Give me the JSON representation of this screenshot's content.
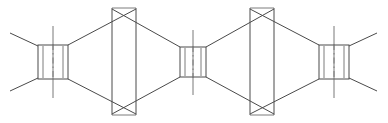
{
  "figure": {
    "background_color": "#ffffff",
    "line_color": "#4a4a4a",
    "secondary_line_color": "#7a7a7a",
    "width": 388,
    "height": 123,
    "view": "front elevation",
    "projection": "orthographic"
  },
  "chart_data": {
    "type": "line",
    "xlabel": "",
    "ylabel": "",
    "xlim": [
      0,
      388
    ],
    "ylim": [
      0,
      123
    ],
    "grid": false,
    "legend": "none"
  },
  "components": {
    "hubs": [
      {
        "name": "left-hub",
        "label": "Left hub",
        "x_left": 38,
        "x_right": 68,
        "y_top": 45,
        "y_bottom": 79,
        "inner_left": 43,
        "inner_right": 63,
        "center_x": 53,
        "has_vertical_axis": true,
        "has_center_dashdot": true
      },
      {
        "name": "middle-hub",
        "label": "Middle hub",
        "x_left": 180,
        "x_right": 206,
        "y_top": 47,
        "y_bottom": 77,
        "inner_left": 185,
        "inner_right": 201,
        "center_x": 193,
        "has_vertical_axis": true,
        "has_center_dashdot": true
      },
      {
        "name": "right-hub",
        "label": "Right hub",
        "x_left": 319,
        "x_right": 349,
        "y_top": 45,
        "y_bottom": 79,
        "inner_left": 324,
        "inner_right": 344,
        "center_x": 334,
        "has_vertical_axis": true,
        "has_center_dashdot": true
      }
    ],
    "cones": [
      {
        "name": "left-cone",
        "label": "Left conical section",
        "small_x": 68,
        "large_x": 180,
        "small_top_y": 45,
        "small_bottom_y": 79,
        "large_top_y": 9,
        "large_bottom_y": 114,
        "direction": "expanding-right-then-contracting"
      },
      {
        "name": "right-cone",
        "label": "Right conical section",
        "small_x": 319,
        "large_x": 206,
        "small_top_y": 45,
        "small_bottom_y": 79,
        "large_top_y": 9,
        "large_bottom_y": 114,
        "direction": "expanding-left-then-contracting"
      }
    ],
    "flanges": [
      {
        "name": "left-flange",
        "label": "Left flange plate",
        "x_left": 112,
        "x_right": 136,
        "y_top": 8,
        "y_bottom": 115
      },
      {
        "name": "right-flange",
        "label": "Right flange plate",
        "x_left": 250,
        "x_right": 274,
        "y_top": 8,
        "y_bottom": 115
      }
    ],
    "legs": [
      {
        "name": "leg-upper-left",
        "label": "Upper left support leg",
        "x1": 38,
        "y1": 46,
        "x2": 10,
        "y2": 33
      },
      {
        "name": "leg-lower-left",
        "label": "Lower left support leg",
        "x1": 38,
        "y1": 78,
        "x2": 10,
        "y2": 91
      },
      {
        "name": "leg-upper-right",
        "label": "Upper right support leg",
        "x1": 349,
        "y1": 46,
        "x2": 377,
        "y2": 33
      },
      {
        "name": "leg-lower-right",
        "label": "Lower right support leg",
        "x1": 349,
        "y1": 78,
        "x2": 377,
        "y2": 91
      }
    ],
    "axis_lines": [
      {
        "name": "left-hub-axis",
        "label": "Left hub vertical axis",
        "x": 53,
        "y1": 26,
        "y2": 98
      },
      {
        "name": "middle-hub-axis",
        "label": "Middle hub vertical axis",
        "x": 193,
        "y1": 30,
        "y2": 95
      },
      {
        "name": "right-hub-axis",
        "label": "Right hub vertical axis",
        "x": 334,
        "y1": 26,
        "y2": 98
      }
    ]
  }
}
